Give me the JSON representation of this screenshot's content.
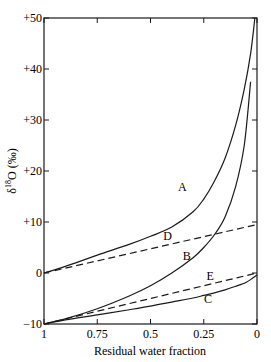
{
  "chart_data": {
    "type": "line",
    "title": "",
    "xlabel": "Residual water fraction",
    "ylabel": "δ¹⁸O (‰)",
    "xlim": [
      1,
      0
    ],
    "ylim": [
      -10,
      50
    ],
    "x_reversed": true,
    "grid": false,
    "legend": "none (curves labeled inline A–E)",
    "x_ticks": [
      1,
      0.75,
      0.5,
      0.25,
      0
    ],
    "x_tick_labels": [
      "1",
      "0.75",
      "0.5",
      "0.25",
      "0"
    ],
    "y_ticks": [
      -10,
      0,
      10,
      20,
      30,
      40,
      50
    ],
    "y_tick_labels": [
      "−10",
      "0",
      "+10",
      "+20",
      "+30",
      "+40",
      "+50"
    ],
    "series": [
      {
        "name": "A",
        "style": "solid",
        "x": [
          1,
          0.9,
          0.75,
          0.6,
          0.5,
          0.4,
          0.3,
          0.25,
          0.2,
          0.15,
          0.1,
          0.06,
          0.03,
          0.01
        ],
        "y": [
          0,
          1.3,
          3.5,
          5.6,
          7.2,
          9.0,
          12.0,
          14.5,
          18.0,
          22.5,
          29.0,
          36.0,
          43.0,
          50.0
        ],
        "label_pos": [
          0.35,
          16
        ]
      },
      {
        "name": "D",
        "style": "dashed",
        "x": [
          1,
          0
        ],
        "y": [
          0,
          9.5
        ],
        "label_pos": [
          0.42,
          6.5
        ]
      },
      {
        "name": "B",
        "style": "solid",
        "x": [
          1,
          0.9,
          0.75,
          0.6,
          0.5,
          0.4,
          0.3,
          0.25,
          0.2,
          0.15,
          0.1,
          0.06,
          0.03
        ],
        "y": [
          -10,
          -9.0,
          -7.0,
          -4.5,
          -2.5,
          0.0,
          3.0,
          5.0,
          7.5,
          11.0,
          17.0,
          25.0,
          37.5
        ],
        "label_pos": [
          0.33,
          2.5
        ]
      },
      {
        "name": "E",
        "style": "dashed",
        "x": [
          1,
          0
        ],
        "y": [
          -10,
          0
        ],
        "label_pos": [
          0.22,
          -1.3
        ]
      },
      {
        "name": "C",
        "style": "solid",
        "x": [
          1,
          0.9,
          0.75,
          0.6,
          0.5,
          0.4,
          0.3,
          0.25,
          0.2,
          0.15,
          0.1,
          0.05,
          0.02,
          0
        ],
        "y": [
          -10,
          -9.2,
          -8.2,
          -7.2,
          -6.5,
          -5.7,
          -4.9,
          -4.4,
          -3.9,
          -3.3,
          -2.6,
          -1.8,
          -1.0,
          -0.4
        ],
        "label_pos": [
          0.23,
          -5.8
        ]
      }
    ]
  }
}
